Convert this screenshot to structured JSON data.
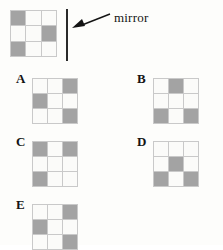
{
  "figure": {
    "type": "mirror-reflection-multiple-choice",
    "colors": {
      "filled_cell": "#a3a3a3",
      "empty_cell": "#fbfbf9",
      "grid_line": "#c9c9c9",
      "ink": "#141414",
      "background": "#fdfdfb"
    },
    "grid_size": "3x3",
    "fill_legend": {
      "1": "shaded",
      "0": "blank"
    }
  },
  "prompt": {
    "name": "original-pattern",
    "cells": [
      [
        1,
        0,
        0
      ],
      [
        0,
        0,
        1
      ],
      [
        1,
        0,
        0
      ]
    ]
  },
  "mirror": {
    "label": "mirror",
    "orientation": "vertical",
    "arrow": "left-pointing-arrow"
  },
  "options": [
    {
      "letter": "A",
      "cells": [
        [
          0,
          0,
          1
        ],
        [
          1,
          0,
          0
        ],
        [
          0,
          0,
          1
        ]
      ]
    },
    {
      "letter": "B",
      "cells": [
        [
          0,
          1,
          0
        ],
        [
          0,
          0,
          0
        ],
        [
          1,
          0,
          1
        ]
      ]
    },
    {
      "letter": "C",
      "cells": [
        [
          1,
          0,
          1
        ],
        [
          0,
          0,
          0
        ],
        [
          1,
          0,
          0
        ]
      ]
    },
    {
      "letter": "D",
      "cells": [
        [
          0,
          0,
          0
        ],
        [
          0,
          1,
          0
        ],
        [
          1,
          0,
          1
        ]
      ]
    },
    {
      "letter": "E",
      "cells": [
        [
          0,
          0,
          1
        ],
        [
          1,
          0,
          0
        ],
        [
          0,
          0,
          1
        ]
      ]
    }
  ]
}
